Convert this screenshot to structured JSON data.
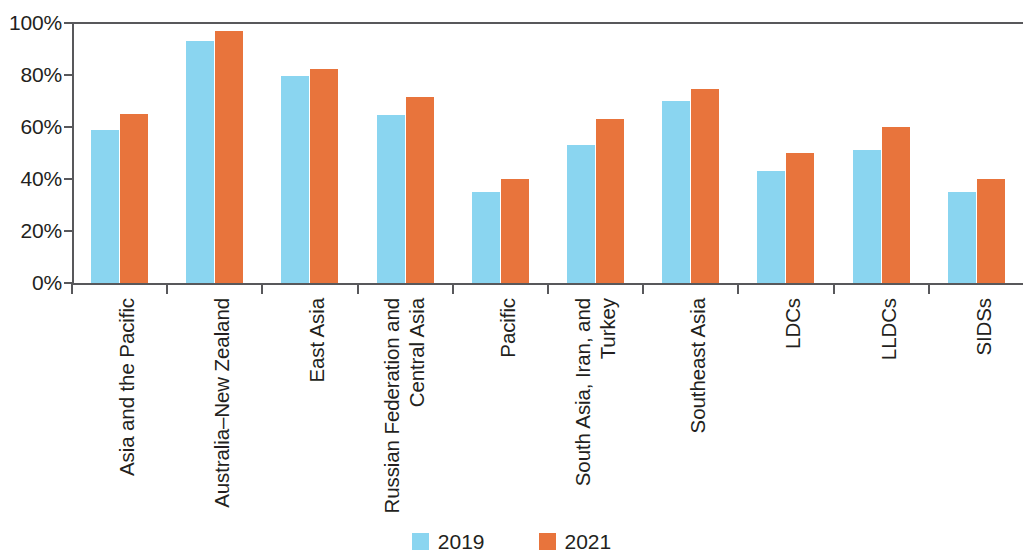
{
  "chart_data": {
    "type": "bar",
    "title": "",
    "subtitle": "",
    "xlabel": "",
    "ylabel": "",
    "ylim": [
      0,
      100
    ],
    "y_ticks": [
      "0%",
      "20%",
      "40%",
      "60%",
      "80%",
      "100%"
    ],
    "y_tick_values": [
      0,
      20,
      40,
      60,
      80,
      100
    ],
    "grid": false,
    "legend_position": "bottom-center",
    "categories": [
      "Asia and the Pacific",
      "Australia–New Zealand",
      "East Asia",
      "Russian Federation and Central Asia",
      "Pacific",
      "South Asia, Iran, and Turkey",
      "Southeast Asia",
      "LDCs",
      "LLDCs",
      "SIDSs"
    ],
    "category_lines": [
      [
        "Asia and the Pacific"
      ],
      [
        "Australia–New Zealand"
      ],
      [
        "East Asia"
      ],
      [
        "Russian Federation and",
        "Central Asia"
      ],
      [
        "Pacific"
      ],
      [
        "South Asia, Iran, and",
        "Turkey"
      ],
      [
        "Southeast Asia"
      ],
      [
        "LDCs"
      ],
      [
        "LLDCs"
      ],
      [
        "SIDSs"
      ]
    ],
    "series": [
      {
        "name": "2019",
        "color": "#8ad5f0",
        "values": [
          59,
          93,
          79.5,
          64.5,
          35,
          53,
          70,
          43,
          51,
          35
        ]
      },
      {
        "name": "2021",
        "color": "#e8743c",
        "values": [
          65,
          97,
          82.5,
          71.5,
          40,
          63,
          74.5,
          50,
          60,
          40
        ]
      }
    ]
  },
  "legend": {
    "items": [
      {
        "label": "2019",
        "color": "#8ad5f0"
      },
      {
        "label": "2021",
        "color": "#e8743c"
      }
    ]
  },
  "colors": {
    "series_2019": "#8ad5f0",
    "series_2021": "#e8743c",
    "axis": "#58585b",
    "text": "#231f20",
    "background": "#ffffff"
  }
}
